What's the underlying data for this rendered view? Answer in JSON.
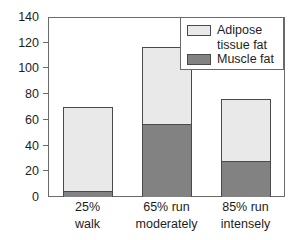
{
  "chart_data": {
    "type": "bar",
    "subtype": "stacked",
    "title": "",
    "xlabel": "",
    "ylabel": "",
    "ylim": [
      0,
      140
    ],
    "yticks": [
      0,
      20,
      40,
      60,
      80,
      100,
      120,
      140
    ],
    "ytick_labels": [
      "0",
      "20",
      "40",
      "60",
      "80",
      "100",
      "120",
      "140"
    ],
    "grid": false,
    "legend_position": "top-right",
    "categories": [
      "25%\nwalk",
      "65% run\nmoderately",
      "85% run\nintensely"
    ],
    "category_labels": [
      {
        "line1": "25%",
        "line2": "walk"
      },
      {
        "line1": "65% run",
        "line2": "moderately"
      },
      {
        "line1": "85% run",
        "line2": "intensely"
      }
    ],
    "series": [
      {
        "name": "Muscle fat",
        "color": "#828282",
        "values": [
          5,
          57,
          28
        ]
      },
      {
        "name": "Adipose tissue fat",
        "color": "#e9e9e9",
        "values": [
          65,
          60,
          48
        ]
      }
    ],
    "totals": [
      70,
      117,
      76
    ],
    "stack_order": [
      "Muscle fat",
      "Adipose tissue fat"
    ]
  },
  "legend": {
    "entries": [
      {
        "label": "Adipose\ntissue fat",
        "swatch": "light"
      },
      {
        "label": "Muscle fat",
        "swatch": "dark"
      }
    ]
  },
  "axis": {
    "y_labels": [
      "140",
      "120",
      "100",
      "80",
      "60",
      "40",
      "20",
      "0"
    ]
  },
  "colors": {
    "adipose": "#e9e9e9",
    "muscle": "#828282",
    "outline": "#4a4a4a",
    "frame": "#6a6a6a",
    "text": "#1d1d1d",
    "background": "#ffffff"
  }
}
